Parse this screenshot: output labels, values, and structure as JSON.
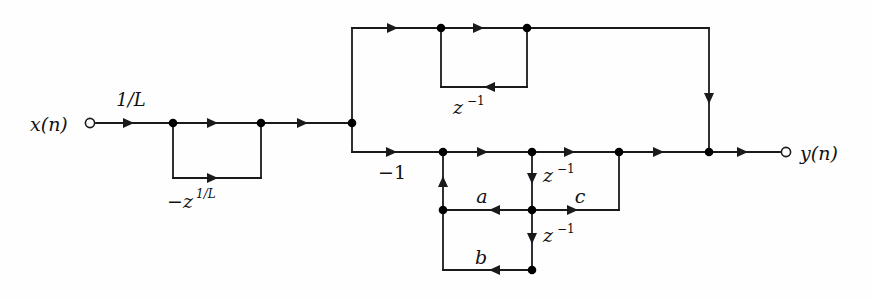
{
  "figure": {
    "type": "signal-flow-graph",
    "background_color": "#fefefe",
    "line_color": "#1a1a1a",
    "text_color": "#111111"
  },
  "terminals": {
    "input": {
      "label": "x(n)",
      "label_base": "x",
      "label_paren": "(n)",
      "x": 90,
      "y": 123
    },
    "output": {
      "label": "y(n)",
      "label_base": "y",
      "label_paren": "(n)",
      "x": 786,
      "y": 152
    }
  },
  "labels": {
    "input_gain": "1/L",
    "left_loop_coefficient_base": "−z",
    "left_loop_coefficient_exponent": "1/L",
    "left_loop_coefficient_full": "−z^(1/L)",
    "upper_delay_base": "z",
    "upper_delay_exponent": "−1",
    "upper_delay_full": "z^(−1)",
    "feedforward_gain": "−1",
    "coefficient_a": "a",
    "coefficient_b": "b",
    "coefficient_c": "c",
    "delay_mid_base": "z",
    "delay_mid_exponent": "−1",
    "delay_lower_base": "z",
    "delay_lower_exponent": "−1",
    "input_label": "x(n)",
    "output_label": "y(n)"
  },
  "label_positions": {
    "input_gain": {
      "x": 131,
      "y": 106
    },
    "left_loop_coef": {
      "x": 191,
      "y": 205
    },
    "upper_delay": {
      "x": 463,
      "y": 112
    },
    "feedforward_gain": {
      "x": 392,
      "y": 177
    },
    "coefficient_a": {
      "x": 482,
      "y": 201
    },
    "coefficient_b": {
      "x": 481,
      "y": 262
    },
    "coefficient_c": {
      "x": 580,
      "y": 201
    },
    "delay_mid": {
      "x": 545,
      "y": 180
    },
    "delay_lower": {
      "x": 545,
      "y": 240
    },
    "input_terminal": {
      "x": 30,
      "y": 131
    },
    "output_terminal": {
      "x": 800,
      "y": 160
    }
  },
  "geometry": {
    "rails": {
      "top_rail_y": 28,
      "main_rail_y": 123,
      "lower_rail_y": 152,
      "mid_branch_y": 210,
      "bottom_branch_y": 270,
      "left_loop_bottom_y": 178,
      "upper_loop_bottom_y": 87
    },
    "columns": {
      "input_terminal_x": 90,
      "left_node_a_x": 173,
      "left_node_b_x": 261,
      "split_x": 352,
      "upper_node_a_x": 441,
      "upper_node_b_x": 527,
      "lower_node_a_x": 443,
      "lower_node_b_x": 532,
      "lower_node_c_x": 619,
      "join_x": 709,
      "output_terminal_x": 786
    }
  },
  "wires": [
    {
      "name": "input-lead",
      "d": "M 96 123 L 173 123"
    },
    {
      "name": "left-loop-top",
      "d": "M 173 123 L 261 123"
    },
    {
      "name": "left-loop-left-down",
      "d": "M 173 123 L 173 178"
    },
    {
      "name": "left-loop-bottom",
      "d": "M 173 178 L 261 178"
    },
    {
      "name": "left-loop-right-up",
      "d": "M 261 178 L 261 123"
    },
    {
      "name": "left-to-split",
      "d": "M 261 123 L 352 123"
    },
    {
      "name": "split-up-to-top-rail",
      "d": "M 352 123 L 352 28"
    },
    {
      "name": "top-rail",
      "d": "M 352 28 L 709 28"
    },
    {
      "name": "upper-loop-left-down",
      "d": "M 441 28 L 441 87"
    },
    {
      "name": "upper-loop-bottom",
      "d": "M 441 87 L 527 87"
    },
    {
      "name": "upper-loop-right-up",
      "d": "M 527 87 L 527 28"
    },
    {
      "name": "top-rail-down-to-join",
      "d": "M 709 28 L 709 152"
    },
    {
      "name": "split-down-to-lower-rail",
      "d": "M 352 123 L 352 152"
    },
    {
      "name": "lower-rail",
      "d": "M 352 152 L 709 152"
    },
    {
      "name": "output-lead",
      "d": "M 709 152 L 780 152"
    },
    {
      "name": "feedback-left-vertical",
      "d": "M 443 152 L 443 210"
    },
    {
      "name": "branch-a-horizontal",
      "d": "M 532 210 L 443 210"
    },
    {
      "name": "delay-mid-vertical",
      "d": "M 532 152 L 532 210"
    },
    {
      "name": "delay-lower-vertical",
      "d": "M 532 210 L 532 270"
    },
    {
      "name": "branch-b-horizontal",
      "d": "M 532 270 L 443 270"
    },
    {
      "name": "branch-b-left-vertical",
      "d": "M 443 270 L 443 210"
    },
    {
      "name": "branch-c-horizontal",
      "d": "M 532 210 L 619 210"
    },
    {
      "name": "branch-c-right-vertical",
      "d": "M 619 210 L 619 152"
    }
  ],
  "arrowheads": [
    {
      "name": "arrow-input-gain",
      "x": 134,
      "y": 123,
      "dir": "right"
    },
    {
      "name": "arrow-left-loop-top",
      "x": 218,
      "y": 123,
      "dir": "right"
    },
    {
      "name": "arrow-left-loop-bottom",
      "x": 218,
      "y": 178,
      "dir": "right"
    },
    {
      "name": "arrow-left-to-split",
      "x": 308,
      "y": 123,
      "dir": "right"
    },
    {
      "name": "arrow-top-rail-1",
      "x": 398,
      "y": 28,
      "dir": "right"
    },
    {
      "name": "arrow-top-rail-2",
      "x": 484,
      "y": 28,
      "dir": "right"
    },
    {
      "name": "arrow-upper-loop-bottom",
      "x": 484,
      "y": 87,
      "dir": "left"
    },
    {
      "name": "arrow-top-rail-down",
      "x": 709,
      "y": 104,
      "dir": "down"
    },
    {
      "name": "arrow-lower-rail-1",
      "x": 397,
      "y": 152,
      "dir": "right"
    },
    {
      "name": "arrow-lower-rail-2",
      "x": 488,
      "y": 152,
      "dir": "right"
    },
    {
      "name": "arrow-lower-rail-3",
      "x": 575,
      "y": 152,
      "dir": "right"
    },
    {
      "name": "arrow-lower-rail-4",
      "x": 664,
      "y": 152,
      "dir": "right"
    },
    {
      "name": "arrow-output-lead",
      "x": 748,
      "y": 152,
      "dir": "right"
    },
    {
      "name": "arrow-feedback-up",
      "x": 443,
      "y": 176,
      "dir": "up"
    },
    {
      "name": "arrow-coefficient-a",
      "x": 489,
      "y": 210,
      "dir": "left"
    },
    {
      "name": "arrow-delay-mid-down",
      "x": 532,
      "y": 184,
      "dir": "down"
    },
    {
      "name": "arrow-delay-lower-down",
      "x": 532,
      "y": 244,
      "dir": "down"
    },
    {
      "name": "arrow-coefficient-b",
      "x": 489,
      "y": 270,
      "dir": "left"
    },
    {
      "name": "arrow-coefficient-c",
      "x": 578,
      "y": 210,
      "dir": "right"
    }
  ],
  "nodes": [
    {
      "name": "node-left-loop-in",
      "x": 173,
      "y": 123
    },
    {
      "name": "node-left-loop-out",
      "x": 261,
      "y": 123
    },
    {
      "name": "node-split",
      "x": 352,
      "y": 123
    },
    {
      "name": "node-upper-loop-in",
      "x": 441,
      "y": 28
    },
    {
      "name": "node-upper-loop-out",
      "x": 527,
      "y": 28
    },
    {
      "name": "node-lower-rail-a",
      "x": 443,
      "y": 152
    },
    {
      "name": "node-lower-rail-b",
      "x": 532,
      "y": 152
    },
    {
      "name": "node-lower-rail-c",
      "x": 619,
      "y": 152
    },
    {
      "name": "node-join",
      "x": 709,
      "y": 152
    },
    {
      "name": "node-feedback-left",
      "x": 443,
      "y": 210
    },
    {
      "name": "node-mid-tap",
      "x": 532,
      "y": 210
    },
    {
      "name": "node-bottom-tap",
      "x": 532,
      "y": 270
    }
  ]
}
